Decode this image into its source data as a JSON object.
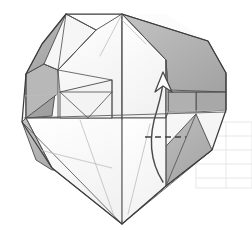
{
  "figure": {
    "title": "Origami folding step diagram",
    "canvas": {
      "width": 252,
      "height": 230,
      "background": "#ffffff"
    },
    "colors": {
      "paper_white": "#fdfdfd",
      "paper_white_2": "#f7f7f7",
      "paper_light": "#efefef",
      "shade_gray": "#a9a9a9",
      "shade_gray_2": "#b5b5b5",
      "shade_gray_3": "#9d9d9d",
      "shade_gray_light": "#c4c4c4",
      "outline_dark": "#3a3a3a",
      "crease_line": "#6f6f6f",
      "crease_faint": "#c9c9c9",
      "ghost_grid": "#e3e3e3",
      "arrow": "#4a4a4a"
    },
    "annotations": {
      "fold_arrow_label": "fold-up-arrow",
      "dashed_line_label": "valley-fold-dashed-line",
      "arrow_direction": "up"
    },
    "ghost_grid": {
      "label": "faint-background-grid",
      "rows": 4,
      "x": 196,
      "y": 122,
      "width": 56,
      "height": 66
    },
    "shapes": {
      "outer_outline": "66,14 122,14 166,14 208,41 226,73 226,110 212,150 166,186 122,224 78,186 36,160 22,122 26,74 42,44",
      "shaded_facets": [
        "66,14 40,46 24,116 52,116 60,66 96,30",
        "122,14 204,40 226,74 214,106 166,60 124,34",
        "168,90 226,90 226,110 196,112 168,110",
        "26,118 52,160 112,160 60,118",
        "150,160 196,112 212,150 166,186 132,180",
        "44,66 70,56 112,80 60,92",
        "60,66 98,62 112,80 62,92"
      ],
      "white_facets": [
        "96,30 122,14 122,118 60,118 60,66",
        "122,14 166,60 166,118 122,118",
        "24,116 60,118 122,118 122,224 52,160",
        "122,118 166,118 166,186 122,224",
        "62,92 112,80 112,118 62,118"
      ],
      "crease_lines": [
        "122,14 122,224",
        "24,116 226,112",
        "60,66 112,80",
        "60,92 112,92",
        "60,66 60,118",
        "112,80 112,118",
        "44,66 60,92",
        "96,30 60,66",
        "122,14 166,60",
        "166,60 166,186",
        "26,74 26,118",
        "52,116 52,160",
        "166,110 196,112"
      ],
      "dashed_line": "145,137 186,137",
      "fold_arrow_path": "M 163,182 C 150,160 150,135 157,108 C 161,94 163,86 163,78",
      "fold_arrow_head": "163,72 156,90 163,84 171,90"
    }
  }
}
